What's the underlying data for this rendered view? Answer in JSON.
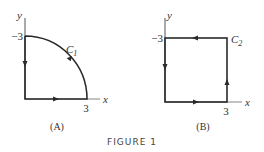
{
  "figure": {
    "title": "FIGURE 1",
    "panels": [
      {
        "id": "A",
        "caption": "(A)",
        "curve_label": "C",
        "curve_subscript": "1",
        "x_axis_label": "x",
        "y_axis_label": "y",
        "x_tick": "3",
        "y_tick": "−3",
        "shape": "quarter-circle"
      },
      {
        "id": "B",
        "caption": "(B)",
        "curve_label": "C",
        "curve_subscript": "2",
        "x_axis_label": "x",
        "y_axis_label": "y",
        "x_tick": "3",
        "y_tick": "−3",
        "shape": "square"
      }
    ]
  },
  "colors": {
    "line": "#2a2a2a",
    "axis": "#666666"
  }
}
